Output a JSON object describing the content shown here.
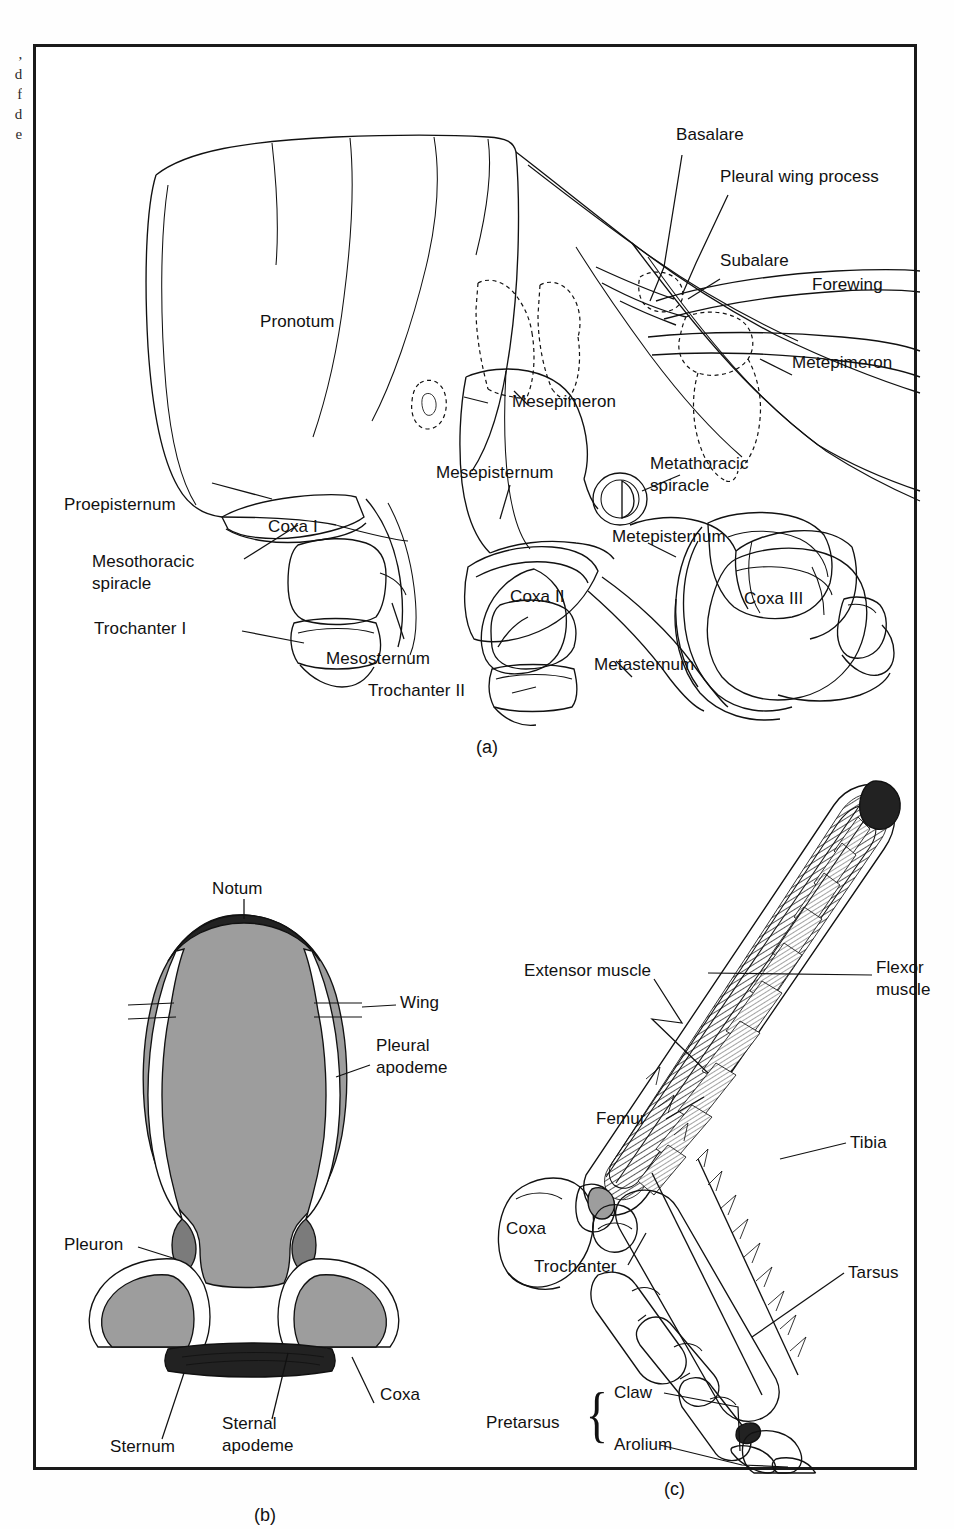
{
  "caption_fragment": {
    "lines": [
      ",",
      "d",
      "f",
      "d",
      "e"
    ],
    "text": ",\nd\nf\nd\ne"
  },
  "figure": {
    "panels": [
      {
        "id": "a",
        "letter": "(a)",
        "name": "lateral-view-of-thorax",
        "labels": [
          {
            "key": "basalare",
            "text": "Basalare"
          },
          {
            "key": "pleural_wing_process",
            "text": "Pleural wing process"
          },
          {
            "key": "subalare",
            "text": "Subalare"
          },
          {
            "key": "forewing",
            "text": "Forewing"
          },
          {
            "key": "metepimeron",
            "text": "Metepimeron"
          },
          {
            "key": "pronotum",
            "text": "Pronotum"
          },
          {
            "key": "mesepimeron",
            "text": "Mesepimeron"
          },
          {
            "key": "mesepisternum",
            "text": "Mesepisternum"
          },
          {
            "key": "metathoracic_spiracle",
            "text": "Metathoracic\nspiracle"
          },
          {
            "key": "metepisternum",
            "text": "Metepisternum"
          },
          {
            "key": "proepisternum",
            "text": "Proepisternum"
          },
          {
            "key": "coxa_i",
            "text": "Coxa I"
          },
          {
            "key": "mesothoracic_spiracle",
            "text": "Mesothoracic\nspiracle"
          },
          {
            "key": "trochanter_i",
            "text": "Trochanter I"
          },
          {
            "key": "mesosternum",
            "text": "Mesosternum"
          },
          {
            "key": "trochanter_ii",
            "text": "Trochanter II"
          },
          {
            "key": "coxa_ii",
            "text": "Coxa II"
          },
          {
            "key": "metasternum",
            "text": "Metasternum"
          },
          {
            "key": "coxa_iii",
            "text": "Coxa III"
          }
        ]
      },
      {
        "id": "b",
        "letter": "(b)",
        "name": "cross-section-of-thoracic-segment",
        "labels": [
          {
            "key": "notum",
            "text": "Notum"
          },
          {
            "key": "wing",
            "text": "Wing"
          },
          {
            "key": "pleural_apodeme",
            "text": "Pleural\napodeme"
          },
          {
            "key": "pleuron",
            "text": "Pleuron"
          },
          {
            "key": "coxa",
            "text": "Coxa"
          },
          {
            "key": "sternum",
            "text": "Sternum"
          },
          {
            "key": "sternal_apodeme",
            "text": "Sternal\napodeme"
          }
        ]
      },
      {
        "id": "c",
        "letter": "(c)",
        "name": "insect-leg-with-musculature",
        "labels": [
          {
            "key": "extensor_muscle",
            "text": "Extensor muscle"
          },
          {
            "key": "flexor_muscle",
            "text": "Flexor\nmuscle"
          },
          {
            "key": "tibia",
            "text": "Tibia"
          },
          {
            "key": "femur",
            "text": "Femur"
          },
          {
            "key": "coxa",
            "text": "Coxa"
          },
          {
            "key": "trochanter",
            "text": "Trochanter"
          },
          {
            "key": "tarsus",
            "text": "Tarsus"
          },
          {
            "key": "pretarsus",
            "text": "Pretarsus"
          },
          {
            "key": "claw",
            "text": "Claw"
          },
          {
            "key": "arolium",
            "text": "Arolium"
          },
          {
            "key": "brace",
            "text": "{"
          }
        ]
      }
    ]
  },
  "colors": {
    "ink": "#111111",
    "frame": "#1a1a1a",
    "page": "#fefefe",
    "panel_bg": "#ffffff",
    "grey_fill": "#9d9d9d",
    "dark_grey_fill": "#7b7b7b"
  }
}
